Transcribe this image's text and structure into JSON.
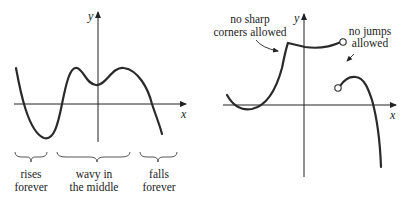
{
  "left_graph": {
    "axis_x_label": "x",
    "axis_y_label": "y",
    "annotations": [
      {
        "line1": "rises",
        "line2": "forever"
      },
      {
        "line1": "wavy in",
        "line2": "the middle"
      },
      {
        "line1": "falls",
        "line2": "forever"
      }
    ]
  },
  "right_graph": {
    "axis_x_label": "x",
    "axis_y_label": "y",
    "annotations": [
      {
        "line1": "no sharp",
        "line2": "corners allowed"
      },
      {
        "line1": "no jumps",
        "line2": "allowed"
      }
    ]
  },
  "colors": {
    "stroke": "#2a2a2a",
    "background": "#ffffff"
  }
}
